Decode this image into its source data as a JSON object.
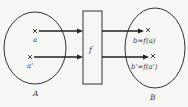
{
  "diagram": {
    "set_a": {
      "label": "A",
      "elements": [
        {
          "name": "a"
        },
        {
          "name": "a'"
        }
      ]
    },
    "set_b": {
      "label": "B",
      "elements": [
        {
          "name": "b=f(a)"
        },
        {
          "name": "b'=f(a')"
        }
      ]
    },
    "function_box": {
      "label": "f"
    },
    "colors": {
      "stroke": "#333333",
      "background": "#f6f6f4",
      "text": "#444444"
    }
  }
}
